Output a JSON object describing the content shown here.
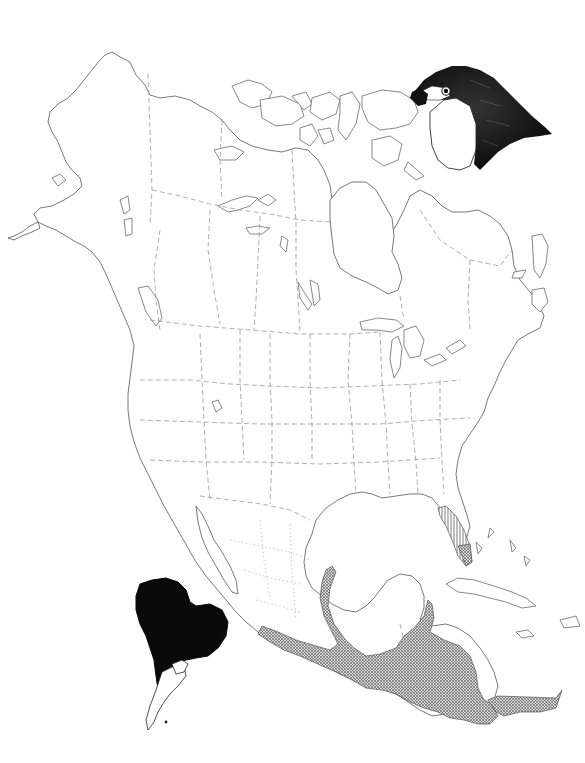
{
  "map": {
    "subject": "Species range map of North and Central America",
    "inset": "South America range inset",
    "illustration": "Falcon head",
    "colors": {
      "background": "#ffffff",
      "coastline": "#6a6a6a",
      "political_border": "#9a9a9a",
      "range_fill": "#8c8c8c",
      "florida_hatch": "#555555",
      "inset_fill": "#0a0a0a"
    },
    "legend": {
      "crosshatch_region": "Year-round range (Mexico, Central America, southern Florida)",
      "hatched_region": "Peninsular Florida",
      "solid_black_inset": "South America range"
    }
  }
}
